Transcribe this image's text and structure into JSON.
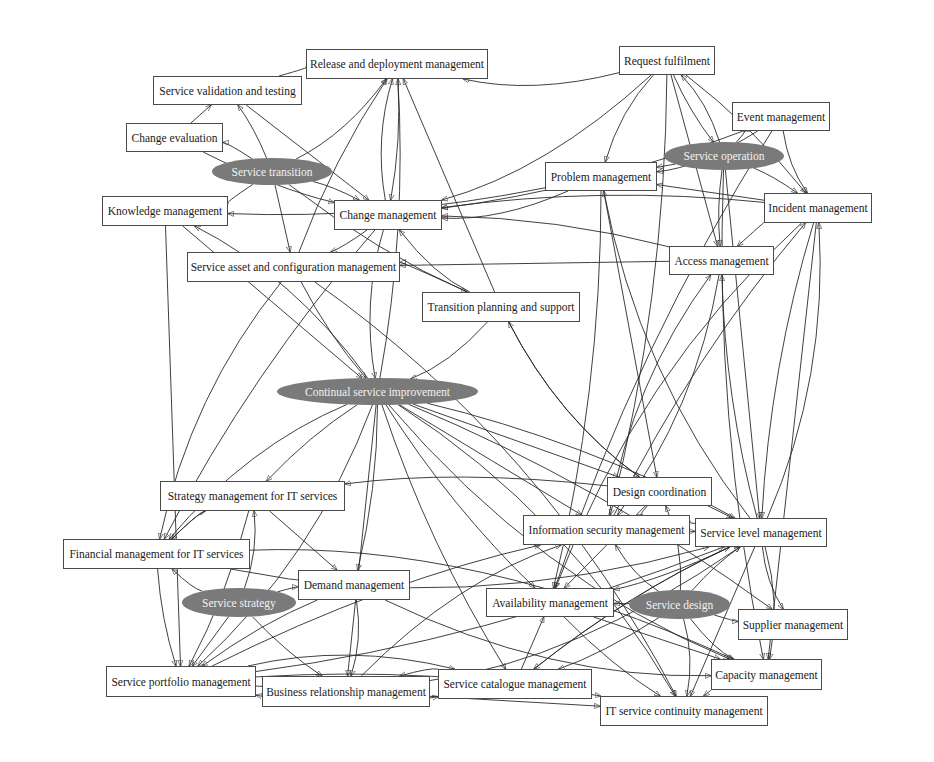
{
  "diagram": {
    "type": "directed-graph",
    "theme": {
      "box_border": "#4a4a4a",
      "ellipse_fill": "#7a7a7a",
      "ellipse_text": "#f2f2f2",
      "edge_color": "#2b2b2b"
    },
    "nodes": [
      {
        "id": "release",
        "label": "Release and deployment management",
        "shape": "box",
        "x": 306,
        "y": 49,
        "w": 182,
        "h": 30
      },
      {
        "id": "request",
        "label": "Request fulfilment",
        "shape": "box",
        "x": 619,
        "y": 46,
        "w": 96,
        "h": 29
      },
      {
        "id": "validation",
        "label": "Service validation and testing",
        "shape": "box",
        "x": 153,
        "y": 76,
        "w": 149,
        "h": 29
      },
      {
        "id": "change_eval",
        "label": "Change evaluation",
        "shape": "box",
        "x": 126,
        "y": 123,
        "w": 97,
        "h": 29
      },
      {
        "id": "event",
        "label": "Event management",
        "shape": "box",
        "x": 732,
        "y": 102,
        "w": 98,
        "h": 29
      },
      {
        "id": "svc_transition",
        "label": "Service transition",
        "shape": "ellipse",
        "x": 212,
        "y": 158,
        "w": 120,
        "h": 27
      },
      {
        "id": "svc_operation",
        "label": "Service operation",
        "shape": "ellipse",
        "x": 664,
        "y": 142,
        "w": 120,
        "h": 28
      },
      {
        "id": "problem",
        "label": "Problem management",
        "shape": "box",
        "x": 545,
        "y": 162,
        "w": 112,
        "h": 29
      },
      {
        "id": "knowledge",
        "label": "Knowledge management",
        "shape": "box",
        "x": 102,
        "y": 196,
        "w": 126,
        "h": 30
      },
      {
        "id": "change",
        "label": "Change management",
        "shape": "box",
        "x": 334,
        "y": 200,
        "w": 108,
        "h": 30
      },
      {
        "id": "incident",
        "label": "Incident management",
        "shape": "box",
        "x": 764,
        "y": 193,
        "w": 108,
        "h": 30
      },
      {
        "id": "asset",
        "label": "Service asset and configuration management",
        "shape": "box",
        "x": 187,
        "y": 252,
        "w": 213,
        "h": 30
      },
      {
        "id": "access",
        "label": "Access management",
        "shape": "box",
        "x": 669,
        "y": 246,
        "w": 105,
        "h": 29
      },
      {
        "id": "transition_planning",
        "label": "Transition planning and support",
        "shape": "box",
        "x": 422,
        "y": 292,
        "w": 158,
        "h": 30
      },
      {
        "id": "csi",
        "label": "Continual service improvement",
        "shape": "ellipse",
        "x": 277,
        "y": 378,
        "w": 201,
        "h": 27
      },
      {
        "id": "strategy_mgmt",
        "label": "Strategy management for IT services",
        "shape": "box",
        "x": 160,
        "y": 481,
        "w": 185,
        "h": 30
      },
      {
        "id": "design_coord",
        "label": "Design coordination",
        "shape": "box",
        "x": 607,
        "y": 477,
        "w": 105,
        "h": 29
      },
      {
        "id": "info_sec",
        "label": "Information security management",
        "shape": "box",
        "x": 523,
        "y": 515,
        "w": 167,
        "h": 30
      },
      {
        "id": "slm",
        "label": "Service level management",
        "shape": "box",
        "x": 695,
        "y": 518,
        "w": 132,
        "h": 29
      },
      {
        "id": "financial",
        "label": "Financial management for IT services",
        "shape": "box",
        "x": 63,
        "y": 539,
        "w": 187,
        "h": 30
      },
      {
        "id": "demand",
        "label": "Demand management",
        "shape": "box",
        "x": 298,
        "y": 570,
        "w": 112,
        "h": 30
      },
      {
        "id": "svc_strategy",
        "label": "Service strategy",
        "shape": "ellipse",
        "x": 182,
        "y": 588,
        "w": 114,
        "h": 29
      },
      {
        "id": "availability",
        "label": "Availability management",
        "shape": "box",
        "x": 486,
        "y": 588,
        "w": 128,
        "h": 29
      },
      {
        "id": "svc_design",
        "label": "Service design",
        "shape": "ellipse",
        "x": 629,
        "y": 590,
        "w": 101,
        "h": 29
      },
      {
        "id": "supplier",
        "label": "Supplier management",
        "shape": "box",
        "x": 738,
        "y": 609,
        "w": 110,
        "h": 31
      },
      {
        "id": "portfolio",
        "label": "Service portfolio management",
        "shape": "box",
        "x": 106,
        "y": 666,
        "w": 150,
        "h": 31
      },
      {
        "id": "brm",
        "label": "Business relationship management",
        "shape": "box",
        "x": 262,
        "y": 676,
        "w": 168,
        "h": 31
      },
      {
        "id": "catalogue",
        "label": "Service catalogue management",
        "shape": "box",
        "x": 438,
        "y": 669,
        "w": 154,
        "h": 30
      },
      {
        "id": "capacity",
        "label": "Capacity management",
        "shape": "box",
        "x": 711,
        "y": 659,
        "w": 111,
        "h": 31
      },
      {
        "id": "itscm",
        "label": "IT service continuity management",
        "shape": "box",
        "x": 600,
        "y": 696,
        "w": 168,
        "h": 30
      }
    ],
    "edges": [
      [
        "request",
        "release"
      ],
      [
        "validation",
        "release"
      ],
      [
        "change_eval",
        "validation"
      ],
      [
        "svc_transition",
        "validation"
      ],
      [
        "svc_transition",
        "change_eval"
      ],
      [
        "svc_transition",
        "knowledge"
      ],
      [
        "svc_transition",
        "change"
      ],
      [
        "svc_transition",
        "asset"
      ],
      [
        "svc_transition",
        "transition_planning"
      ],
      [
        "svc_transition",
        "release"
      ],
      [
        "change",
        "release"
      ],
      [
        "asset",
        "release"
      ],
      [
        "transition_planning",
        "release"
      ],
      [
        "csi",
        "release"
      ],
      [
        "request",
        "problem"
      ],
      [
        "request",
        "change"
      ],
      [
        "request",
        "incident"
      ],
      [
        "request",
        "access"
      ],
      [
        "request",
        "svc_operation"
      ],
      [
        "svc_operation",
        "request"
      ],
      [
        "svc_operation",
        "event"
      ],
      [
        "svc_operation",
        "incident"
      ],
      [
        "svc_operation",
        "problem"
      ],
      [
        "svc_operation",
        "access"
      ],
      [
        "event",
        "incident"
      ],
      [
        "event",
        "problem"
      ],
      [
        "event",
        "change"
      ],
      [
        "incident",
        "problem"
      ],
      [
        "incident",
        "change"
      ],
      [
        "incident",
        "access"
      ],
      [
        "problem",
        "change"
      ],
      [
        "problem",
        "knowledge"
      ],
      [
        "access",
        "asset"
      ],
      [
        "access",
        "change"
      ],
      [
        "transition_planning",
        "asset"
      ],
      [
        "transition_planning",
        "change"
      ],
      [
        "change",
        "asset"
      ],
      [
        "knowledge",
        "csi"
      ],
      [
        "asset",
        "csi"
      ],
      [
        "change",
        "csi"
      ],
      [
        "transition_planning",
        "csi"
      ],
      [
        "csi",
        "slm"
      ],
      [
        "csi",
        "info_sec"
      ],
      [
        "csi",
        "availability"
      ],
      [
        "csi",
        "capacity"
      ],
      [
        "csi",
        "itscm"
      ],
      [
        "csi",
        "supplier"
      ],
      [
        "csi",
        "design_coord"
      ],
      [
        "csi",
        "strategy_mgmt"
      ],
      [
        "csi",
        "financial"
      ],
      [
        "csi",
        "portfolio"
      ],
      [
        "csi",
        "demand"
      ],
      [
        "csi",
        "brm"
      ],
      [
        "csi",
        "catalogue"
      ],
      [
        "csi",
        "knowledge"
      ],
      [
        "design_coord",
        "info_sec"
      ],
      [
        "design_coord",
        "slm"
      ],
      [
        "design_coord",
        "availability"
      ],
      [
        "design_coord",
        "strategy_mgmt"
      ],
      [
        "svc_design",
        "design_coord"
      ],
      [
        "svc_design",
        "info_sec"
      ],
      [
        "svc_design",
        "slm"
      ],
      [
        "svc_design",
        "availability"
      ],
      [
        "svc_design",
        "supplier"
      ],
      [
        "svc_design",
        "capacity"
      ],
      [
        "svc_design",
        "itscm"
      ],
      [
        "svc_design",
        "catalogue"
      ],
      [
        "info_sec",
        "slm"
      ],
      [
        "slm",
        "info_sec"
      ],
      [
        "slm",
        "supplier"
      ],
      [
        "slm",
        "capacity"
      ],
      [
        "slm",
        "availability"
      ],
      [
        "slm",
        "itscm"
      ],
      [
        "slm",
        "catalogue"
      ],
      [
        "slm",
        "incident"
      ],
      [
        "slm",
        "problem"
      ],
      [
        "slm",
        "access"
      ],
      [
        "availability",
        "capacity"
      ],
      [
        "availability",
        "itscm"
      ],
      [
        "capacity",
        "itscm"
      ],
      [
        "info_sec",
        "access"
      ],
      [
        "info_sec",
        "incident"
      ],
      [
        "incident",
        "capacity"
      ],
      [
        "incident",
        "slm"
      ],
      [
        "svc_strategy",
        "strategy_mgmt"
      ],
      [
        "svc_strategy",
        "financial"
      ],
      [
        "svc_strategy",
        "demand"
      ],
      [
        "svc_strategy",
        "portfolio"
      ],
      [
        "svc_strategy",
        "brm"
      ],
      [
        "strategy_mgmt",
        "financial"
      ],
      [
        "financial",
        "strategy_mgmt"
      ],
      [
        "strategy_mgmt",
        "portfolio"
      ],
      [
        "strategy_mgmt",
        "demand"
      ],
      [
        "demand",
        "portfolio"
      ],
      [
        "demand",
        "capacity"
      ],
      [
        "demand",
        "brm"
      ],
      [
        "brm",
        "portfolio"
      ],
      [
        "portfolio",
        "brm"
      ],
      [
        "brm",
        "catalogue"
      ],
      [
        "catalogue",
        "brm"
      ],
      [
        "portfolio",
        "catalogue"
      ],
      [
        "portfolio",
        "itscm"
      ],
      [
        "brm",
        "itscm"
      ],
      [
        "financial",
        "portfolio"
      ],
      [
        "financial",
        "slm"
      ],
      [
        "financial",
        "capacity"
      ],
      [
        "catalogue",
        "slm"
      ],
      [
        "catalogue",
        "availability"
      ],
      [
        "portfolio",
        "slm"
      ],
      [
        "brm",
        "slm"
      ],
      [
        "brm",
        "info_sec"
      ],
      [
        "portfolio",
        "info_sec"
      ],
      [
        "knowledge",
        "portfolio"
      ],
      [
        "change",
        "financial"
      ],
      [
        "asset",
        "financial"
      ],
      [
        "asset",
        "itscm"
      ],
      [
        "release",
        "change"
      ],
      [
        "validation",
        "change"
      ],
      [
        "change_eval",
        "change"
      ],
      [
        "transition_planning",
        "design_coord"
      ],
      [
        "design_coord",
        "transition_planning"
      ],
      [
        "problem",
        "availability"
      ],
      [
        "problem",
        "design_coord"
      ],
      [
        "event",
        "availability"
      ],
      [
        "incident",
        "availability"
      ],
      [
        "access",
        "info_sec"
      ],
      [
        "request",
        "info_sec"
      ],
      [
        "svc_operation",
        "slm"
      ],
      [
        "svc_operation",
        "capacity"
      ]
    ]
  }
}
